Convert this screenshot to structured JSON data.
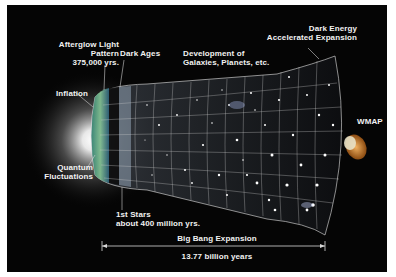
{
  "diagram": {
    "labels": {
      "afterglow_line1": "Afterglow Light",
      "afterglow_line2": "Pattern",
      "afterglow_line3": "375,000 yrs.",
      "dark_ages": "Dark Ages",
      "development_line1": "Development of",
      "development_line2": "Galaxies, Planets, etc.",
      "dark_energy_line1": "Dark Energy",
      "dark_energy_line2": "Accelerated Expansion",
      "inflation": "Inflation",
      "quantum_line1": "Quantum",
      "quantum_line2": "Fluctuations",
      "first_stars_line1": "1st Stars",
      "first_stars_line2": "about 400 million yrs.",
      "wmap": "WMAP",
      "expansion": "Big Bang Expansion",
      "age": "13.77 billion years"
    },
    "colors": {
      "background": "#050505",
      "border": "#ffffff",
      "text": "#f2f2f2",
      "afterglow": "#4fa08a",
      "grid": "#cfcfcf",
      "wmap_dish": "#c8731e"
    }
  }
}
